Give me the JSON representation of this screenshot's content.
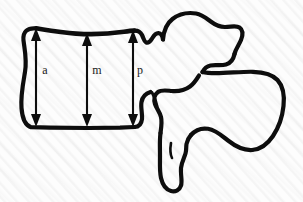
{
  "figure": {
    "name": "vertebra-height-measurement-diagram",
    "caption": "",
    "background_color": "#fdfdfd",
    "ink_color": "#0d0d0d",
    "width": 303,
    "height": 202
  },
  "measurements": [
    {
      "id": "anterior",
      "label": "a",
      "label_x": 45,
      "label_y": 70,
      "x": 36,
      "y_top": 29,
      "y_bottom": 126,
      "arrowheads": "both"
    },
    {
      "id": "middle",
      "label": "m",
      "label_x": 97,
      "label_y": 70,
      "x": 87,
      "y_top": 34,
      "y_bottom": 126,
      "arrowheads": "both"
    },
    {
      "id": "posterior",
      "label": "p",
      "label_x": 140,
      "label_y": 70,
      "x": 133,
      "y_top": 31,
      "y_bottom": 126,
      "arrowheads": "both"
    }
  ],
  "anatomy": {
    "outline_name": "lumbar-vertebra-lateral-outline",
    "parts": [
      "vertebral-body",
      "pedicle",
      "superior-articular-process",
      "transverse-process",
      "inferior-articular-process",
      "spinous-process"
    ]
  }
}
